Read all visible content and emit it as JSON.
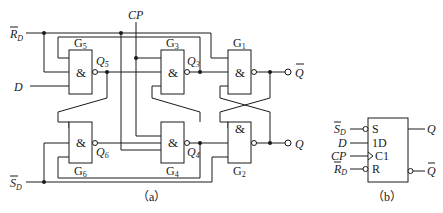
{
  "figure_a": {
    "caption": "（a）",
    "inputs": {
      "rd": {
        "main": "R",
        "sub": "D",
        "overbar": true
      },
      "sd": {
        "main": "S",
        "sub": "D",
        "overbar": true
      },
      "d": "D",
      "cp": "CP"
    },
    "gates": [
      {
        "id": "G1",
        "main": "G",
        "sub": "1",
        "symbol": "&"
      },
      {
        "id": "G2",
        "main": "G",
        "sub": "2",
        "symbol": "&"
      },
      {
        "id": "G3",
        "main": "G",
        "sub": "3",
        "symbol": "&"
      },
      {
        "id": "G4",
        "main": "G",
        "sub": "4",
        "symbol": "&"
      },
      {
        "id": "G5",
        "main": "G",
        "sub": "5",
        "symbol": "&"
      },
      {
        "id": "G6",
        "main": "G",
        "sub": "6",
        "symbol": "&"
      }
    ],
    "nodes": {
      "q3": {
        "main": "Q",
        "sub": "3"
      },
      "q4": {
        "main": "Q",
        "sub": "4"
      },
      "q5": {
        "main": "Q",
        "sub": "5"
      },
      "q6": {
        "main": "Q",
        "sub": "6"
      }
    },
    "outputs": {
      "qbar": {
        "main": "Q",
        "overbar": true
      },
      "q": {
        "main": "Q"
      }
    }
  },
  "figure_b": {
    "caption": "（b）",
    "pins_left": [
      {
        "ext_main": "S",
        "ext_sub": "D",
        "overbar": true,
        "inner": "S",
        "bubble": true
      },
      {
        "ext_main": "D",
        "inner": "1D",
        "bubble": false
      },
      {
        "ext_main": "CP",
        "inner": "C1",
        "clock": true
      },
      {
        "ext_main": "R",
        "ext_sub": "D",
        "overbar": true,
        "inner": "R",
        "bubble": true
      }
    ],
    "pins_right": [
      {
        "ext_main": "Q",
        "bubble": false
      },
      {
        "ext_main": "Q",
        "overbar": true,
        "bubble": true
      }
    ]
  }
}
